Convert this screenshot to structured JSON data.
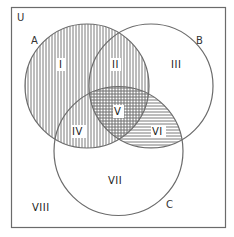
{
  "diagram": {
    "type": "venn",
    "universe_label": "U",
    "sets": [
      {
        "name": "A",
        "shading": "vertical-lines"
      },
      {
        "name": "B",
        "shading": "none"
      },
      {
        "name": "C",
        "shading": "none"
      }
    ],
    "shaded_region_description": "A shaded with vertical lines; B∩C shaded with horizontal lines",
    "regions": [
      {
        "id": "I",
        "label": "I",
        "membership": "A only",
        "fill": "vertical"
      },
      {
        "id": "II",
        "label": "II",
        "membership": "A∩B only",
        "fill": "vertical"
      },
      {
        "id": "III",
        "label": "III",
        "membership": "B only",
        "fill": "none"
      },
      {
        "id": "IV",
        "label": "IV",
        "membership": "A∩C only",
        "fill": "vertical"
      },
      {
        "id": "V",
        "label": "V",
        "membership": "A∩B∩C",
        "fill": "crosshatch"
      },
      {
        "id": "VI",
        "label": "VI",
        "membership": "B∩C only",
        "fill": "horizontal"
      },
      {
        "id": "VII",
        "label": "VII",
        "membership": "C only",
        "fill": "none"
      },
      {
        "id": "VIII",
        "label": "VIII",
        "membership": "outside all",
        "fill": "none"
      }
    ],
    "colors": {
      "outline": "#6b6b6b",
      "hatch": "#7a7a7a",
      "text": "#222222",
      "background": "#ffffff"
    }
  }
}
